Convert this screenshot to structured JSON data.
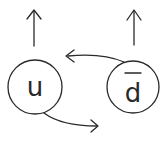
{
  "diagram": {
    "type": "hand-drawn particle/state diagram",
    "nodes": [
      {
        "id": "u",
        "label": "u",
        "overline": false
      },
      {
        "id": "dbar",
        "label": "d",
        "overline": true
      }
    ],
    "edges": [
      {
        "from": "u",
        "to": "right",
        "description": "curved arrow from u toward the right"
      },
      {
        "from": "dbar",
        "to": "left",
        "description": "curved arrow from d-bar toward the left"
      },
      {
        "from": "u",
        "to": "up",
        "description": "upward arrow above u"
      },
      {
        "from": "dbar",
        "to": "up",
        "description": "upward arrow above d-bar"
      }
    ],
    "colors": {
      "ink": "#2a2a2a",
      "background": "#ffffff"
    }
  }
}
